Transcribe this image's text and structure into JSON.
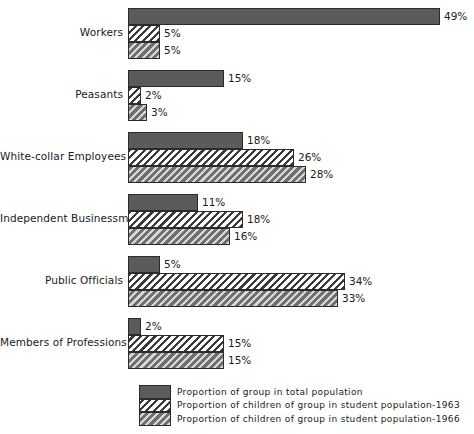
{
  "chart_data": {
    "type": "bar",
    "orientation": "horizontal",
    "title": "",
    "subtitle": "",
    "xlabel": "",
    "ylabel": "",
    "grid": false,
    "xlim": [
      0,
      49
    ],
    "value_suffix": "%",
    "legend_position": "bottom",
    "categories": [
      "Workers",
      "Peasants",
      "White-collar Employees",
      "Independent Businessmen",
      "Public Officials",
      "Members of Professions"
    ],
    "series": [
      {
        "name": "Proportion of group in total population",
        "pattern": "solid",
        "color": "#5b5b5b",
        "values": [
          49,
          15,
          18,
          11,
          5,
          2
        ],
        "labels": [
          "49%",
          "15%",
          "18%",
          "11%",
          "5%",
          "2%"
        ]
      },
      {
        "name": "Proportion of children of group in student population-1963",
        "pattern": "hatch63",
        "color": "#ffffff",
        "values": [
          5,
          2,
          26,
          18,
          34,
          15
        ],
        "labels": [
          "5%",
          "2%",
          "26%",
          "18%",
          "34%",
          "15%"
        ]
      },
      {
        "name": "Proportion of children of group in student population-1966",
        "pattern": "hatch66",
        "color": "#6f6f6f",
        "values": [
          5,
          3,
          28,
          16,
          33,
          15
        ],
        "labels": [
          "5%",
          "3%",
          "28%",
          "16%",
          "33%",
          "15%"
        ]
      }
    ]
  },
  "legend": {
    "items": [
      {
        "label": "Proportion of group in total population",
        "pattern": "solid"
      },
      {
        "label": "Proportion of children of group in student population-1963",
        "pattern": "hatch63"
      },
      {
        "label": "Proportion of children of group in student population-1966",
        "pattern": "hatch66"
      }
    ]
  }
}
